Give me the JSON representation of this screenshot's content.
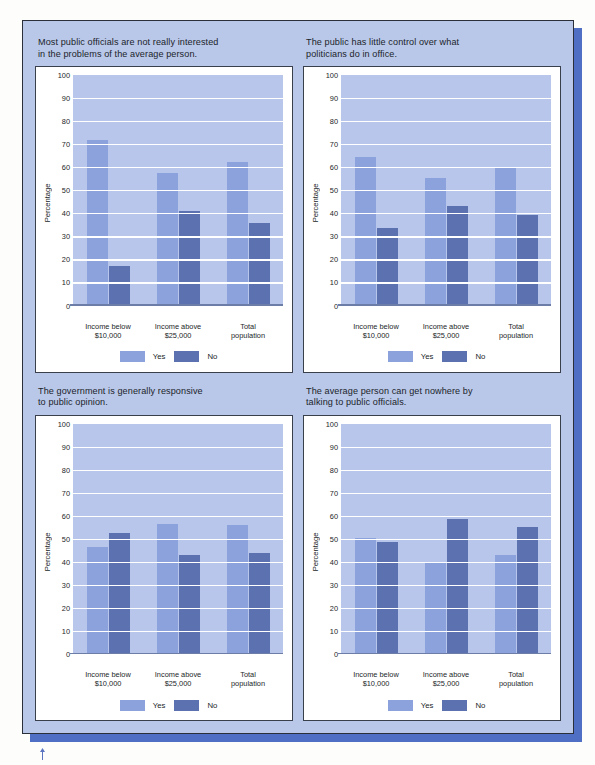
{
  "page": {
    "background_color": "#fdfdfb",
    "panel_color": "#b9c7e9",
    "panel_shadow_color": "#4f6fc4",
    "card_color": "#ffffff"
  },
  "legend": {
    "yes_label": "Yes",
    "no_label": "No",
    "yes_color": "#8ba2dd",
    "no_color": "#5c72b0"
  },
  "axis": {
    "ylabel": "Percentage",
    "yticks": [
      "100",
      "90",
      "80",
      "70",
      "60",
      "50",
      "40",
      "30",
      "20",
      "10",
      "0"
    ],
    "categories": [
      "Income below\n$10,000",
      "Income above\n$25,000",
      "Total\npopulation"
    ]
  },
  "charts": [
    {
      "title": "Most public officials are not really interested\nin the problems of the average person."
    },
    {
      "title": "The public has little control over what\npoliticians do in office."
    },
    {
      "title": "The government is generally responsive\nto public opinion."
    },
    {
      "title": "The average person can get nowhere by\ntalking to public officials."
    }
  ],
  "chart_data": [
    {
      "type": "bar",
      "title": "Most public officials are not really interested in the problems of the average person.",
      "xlabel": "",
      "ylabel": "Percentage",
      "ylim": [
        0,
        100
      ],
      "ytick_step": 10,
      "grid": true,
      "legend_position": "bottom",
      "categories": [
        "Income below $10,000",
        "Income above $25,000",
        "Total population"
      ],
      "series": [
        {
          "name": "Yes",
          "color": "#8ba2dd",
          "values": [
            72,
            57.5,
            62.5
          ]
        },
        {
          "name": "No",
          "color": "#5c72b0",
          "values": [
            17,
            41,
            36
          ]
        }
      ]
    },
    {
      "type": "bar",
      "title": "The public has little control over what politicians do in office.",
      "xlabel": "",
      "ylabel": "Percentage",
      "ylim": [
        0,
        100
      ],
      "ytick_step": 10,
      "grid": true,
      "legend_position": "bottom",
      "categories": [
        "Income below $10,000",
        "Income above $25,000",
        "Total population"
      ],
      "series": [
        {
          "name": "Yes",
          "color": "#8ba2dd",
          "values": [
            64.5,
            55.5,
            59.5
          ]
        },
        {
          "name": "No",
          "color": "#5c72b0",
          "values": [
            33.5,
            43,
            39.5
          ]
        }
      ]
    },
    {
      "type": "bar",
      "title": "The government is generally responsive to public opinion.",
      "xlabel": "",
      "ylabel": "Percentage",
      "ylim": [
        0,
        100
      ],
      "ytick_step": 10,
      "grid": true,
      "legend_position": "bottom",
      "categories": [
        "Income below $10,000",
        "Income above $25,000",
        "Total population"
      ],
      "series": [
        {
          "name": "Yes",
          "color": "#8ba2dd",
          "values": [
            46.5,
            56.5,
            56
          ]
        },
        {
          "name": "No",
          "color": "#5c72b0",
          "values": [
            52.5,
            43,
            44
          ]
        }
      ]
    },
    {
      "type": "bar",
      "title": "The average person can get nowhere by talking to public officials.",
      "xlabel": "",
      "ylabel": "Percentage",
      "ylim": [
        0,
        100
      ],
      "ytick_step": 10,
      "grid": true,
      "legend_position": "bottom",
      "categories": [
        "Income below $10,000",
        "Income above $25,000",
        "Total population"
      ],
      "series": [
        {
          "name": "Yes",
          "color": "#8ba2dd",
          "values": [
            50.5,
            40,
            43
          ]
        },
        {
          "name": "No",
          "color": "#5c72b0",
          "values": [
            48.5,
            58.5,
            55
          ]
        }
      ]
    }
  ]
}
